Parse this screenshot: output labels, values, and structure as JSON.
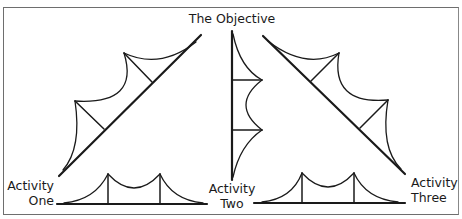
{
  "figure": {
    "title": "The Objective",
    "labels": {
      "activity_one": [
        "Activity",
        "One"
      ],
      "activity_two": [
        "Activity",
        "Two"
      ],
      "activity_three": [
        "Activity",
        "Three"
      ]
    },
    "stroke_color": "#1a1a1a",
    "frame_color": "#6e6e6e",
    "background": "#ffffff"
  }
}
